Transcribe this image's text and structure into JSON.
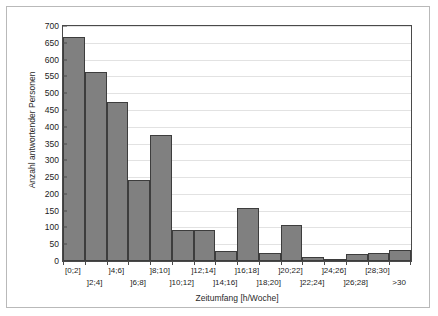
{
  "chart_data": {
    "type": "bar",
    "title": "",
    "subtitle": "",
    "xlabel": "Zeitumfang [h/Woche]",
    "ylabel": "Anzahl antwortender Personen",
    "categories": [
      "[0;2]",
      "]2;4]",
      "]4;6]",
      "]6;8]",
      "]8;10]",
      "]10;12]",
      "]12;14]",
      "]14;16]",
      "]16;18]",
      "]18;20]",
      "]20;22]",
      "]22;24]",
      "]24;26]",
      "]26;28]",
      "[28;30]",
      ">30"
    ],
    "values": [
      667,
      562,
      473,
      240,
      375,
      93,
      93,
      30,
      158,
      25,
      108,
      12,
      2,
      22,
      25,
      32
    ],
    "ylim": [
      0,
      700
    ],
    "yticks": [
      0,
      50,
      100,
      150,
      200,
      250,
      300,
      350,
      400,
      450,
      500,
      550,
      600,
      650,
      700
    ],
    "grid": true,
    "legend": "none",
    "bar_color": "#808080",
    "bar_edge_color": "#3d3d3d",
    "gridline_color": "#e2e2e2",
    "axis_color": "#4a4a4a",
    "frame_color": "#b9b9b9"
  }
}
